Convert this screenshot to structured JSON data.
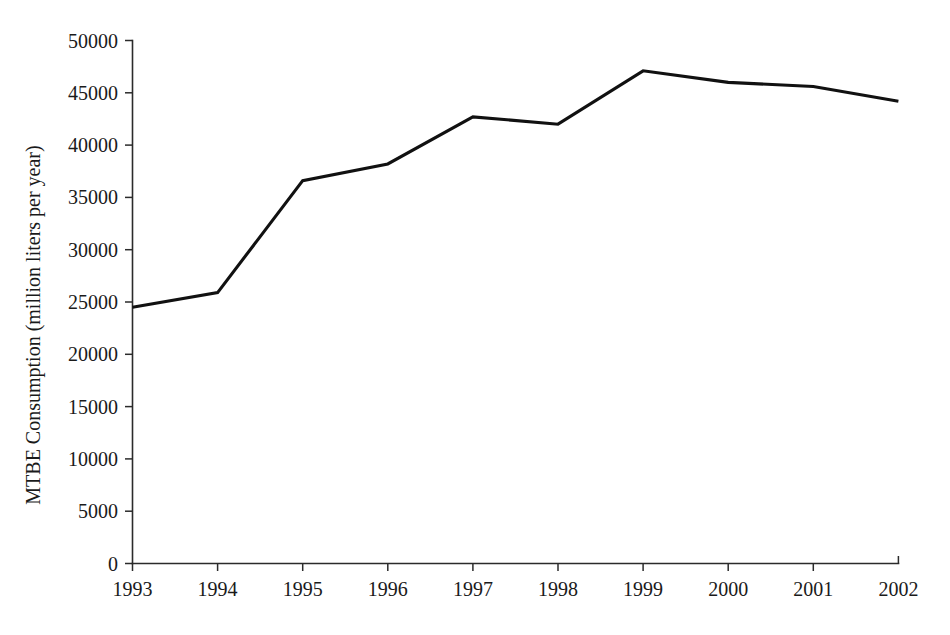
{
  "chart_data": {
    "type": "line",
    "title": "",
    "xlabel": "",
    "ylabel": "MTBE Consumption (million liters per year)",
    "categories": [
      "1993",
      "1994",
      "1995",
      "1996",
      "1997",
      "1998",
      "1999",
      "2000",
      "2001",
      "2002"
    ],
    "values": [
      24500,
      25900,
      36600,
      38200,
      42700,
      42000,
      47100,
      46000,
      45600,
      44200
    ],
    "series": [
      {
        "name": "MTBE Consumption",
        "values": [
          24500,
          25900,
          36600,
          38200,
          42700,
          42000,
          47100,
          46000,
          45600,
          44200
        ]
      }
    ],
    "xlim": [
      1993,
      2002
    ],
    "ylim": [
      0,
      50000
    ],
    "y_ticks": [
      0,
      5000,
      10000,
      15000,
      20000,
      25000,
      30000,
      35000,
      40000,
      45000,
      50000
    ],
    "y_tick_labels": [
      "0",
      "5000",
      "10000",
      "15000",
      "20000",
      "25000",
      "30000",
      "35000",
      "40000",
      "45000",
      "50000"
    ],
    "x_ticks": [
      "1993",
      "1994",
      "1995",
      "1996",
      "1997",
      "1998",
      "1999",
      "2000",
      "2001",
      "2002"
    ],
    "grid": false,
    "legend": false,
    "legend_position": "none",
    "line_color": "#111111",
    "axis_color": "#2b2b2b",
    "background_color": "#ffffff"
  },
  "axes": {
    "y_axis_title": "MTBE Consumption (million liters per year)",
    "x_axis_title": ""
  }
}
